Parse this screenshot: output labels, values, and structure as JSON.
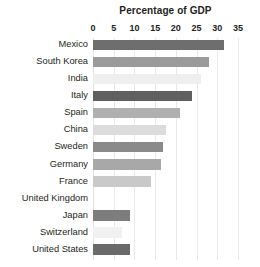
{
  "chart_data": {
    "type": "bar",
    "orientation": "horizontal",
    "title": "Percentage of GDP",
    "xlabel": "",
    "ylabel": "",
    "xlim": [
      0,
      35
    ],
    "xticks": [
      0,
      5,
      10,
      15,
      20,
      25,
      30,
      35
    ],
    "xtick_labels": [
      "0",
      "5",
      "10",
      "15",
      "20",
      "25",
      "30",
      "35"
    ],
    "grid": true,
    "grid_axis": "x",
    "legend": false,
    "categories": [
      "Mexico",
      "South Korea",
      "India",
      "Italy",
      "Spain",
      "China",
      "Sweden",
      "Germany",
      "France",
      "United Kingdom",
      "Japan",
      "Switzerland",
      "United States"
    ],
    "values": [
      31.5,
      28,
      26,
      24,
      21,
      17.5,
      17,
      16.5,
      14,
      0,
      9,
      7,
      9
    ],
    "bar_colors": [
      "#6e6e6e",
      "#9a9a9a",
      "#efefef",
      "#5f5f5f",
      "#b0b0b0",
      "#dcdcdc",
      "#8a8a8a",
      "#a8a8a8",
      "#c9c9c9",
      "#ffffff",
      "#7d7d7d",
      "#f1f1f1",
      "#6a6a6a"
    ]
  },
  "colors": {
    "background": "#ffffff",
    "text": "#231f20",
    "gridline": "#e9e9ea"
  }
}
